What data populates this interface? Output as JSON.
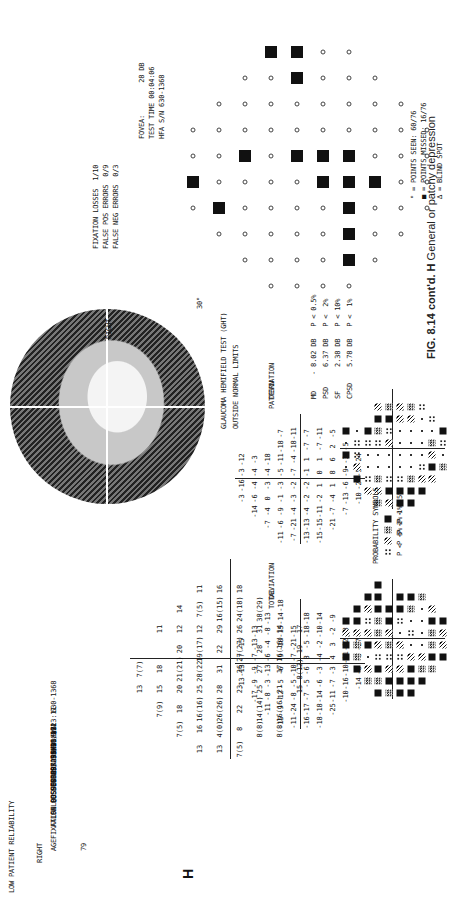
{
  "figure": {
    "caption_label": "FIG. 8.14 cont'd.",
    "caption_panel": "H",
    "caption_text": "General or patchy depression",
    "panel_letter": "H"
  },
  "header_left": {
    "reliability": "LOW PATIENT RELIABILITY",
    "eye": "RIGHT",
    "age_label": "AGE",
    "age": "79",
    "fixation_losses": "FIXATION LOSSES  9/29 xx",
    "false_pos": "FALSE POS ERRORS  5/15 xx",
    "false_neg": "FALSE NEG ERRORS  1/17",
    "questions": "QUESTIONS ASKED  582",
    "fovea": "FOVEA:  30 DB x2",
    "test_time": "TEST TIME 00:13:11",
    "serial": "HFA S/N   630-1368"
  },
  "header_right": {
    "fixation_losses": "FIXATION LOSSES  1/10",
    "false_pos": "FALSE POS ERRORS  0/9",
    "false_neg": "FALSE NEG ERRORS  0/3",
    "fovea": "FOVEA:        28 DB",
    "test_time": "TEST TIME 00:04:06",
    "serial": "HFA S/N 630-1368",
    "eye": "RIGHT",
    "axis_label_top": "30°",
    "axis_label_left": "30°"
  },
  "legend_right": {
    "seen": "° = POINTS SEEN: 60/76",
    "missed": "■ = POINTS MISSED: 16/76",
    "blind_spot": "∆ = BLIND SPOT"
  },
  "grayscale": {
    "axis_label": "30°"
  },
  "indices": {
    "ght": "GLAUCOMA HEMIFIELD TEST (GHT)",
    "ght_result": "OUTSIDE NORMAL LIMITS",
    "rows": [
      {
        "name": "MD",
        "value": "- 8.02 DB",
        "p": "P < 0.5%"
      },
      {
        "name": "PSD",
        "value": "6.37 DB",
        "p": "P <  2%"
      },
      {
        "name": "SF",
        "value": "2.38 DB",
        "p": "P < 10%"
      },
      {
        "name": "CPSD",
        "value": "5.78 DB",
        "p": "P <  1%"
      }
    ]
  },
  "plots": {
    "total_deviation": {
      "label1": "TOTAL",
      "label2": "DEVIATION"
    },
    "pattern_deviation": {
      "label1": "PATTERN",
      "label2": "DEVIATION"
    }
  },
  "probability_symbols": {
    "title": "PROBABILITY SYMBOLS",
    "items": [
      {
        "symbol": "dots4",
        "text": "P <  5%"
      },
      {
        "symbol": "diag",
        "text": "P <  2%"
      },
      {
        "symbol": "chk",
        "text": "P <  1%"
      },
      {
        "symbol": "blk",
        "text": "P < 0.5%"
      }
    ]
  },
  "threshold_values": {
    "rows": [
      [
        "",
        "",
        "",
        "13",
        "7(7)",
        "",
        "",
        "",
        "",
        ""
      ],
      [
        "",
        "",
        "7(9)",
        "15",
        "18",
        "",
        "11",
        "",
        "",
        ""
      ],
      [
        "",
        "7(5)",
        "18",
        "20",
        "21(21)",
        "20",
        "12",
        "14",
        "",
        ""
      ],
      [
        "13",
        "16",
        "16(16)",
        "25",
        "28(22)",
        "19(17)",
        "12",
        "7(5)",
        "11",
        ""
      ],
      [
        "13",
        "4(0)",
        "26(26)",
        "28",
        "31",
        "22",
        "29",
        "16(15)",
        "16",
        ""
      ],
      [
        "7(5)",
        "8",
        "22",
        "23",
        "26",
        "27(27)",
        "26",
        "24(18)",
        "18",
        ""
      ],
      [
        "",
        "8(8)",
        "14(14)",
        "25",
        "27",
        "28",
        "31",
        "38(29)",
        "",
        ""
      ],
      [
        "",
        "8(8)",
        "16(16)",
        "21",
        "17",
        "16(16)",
        "14",
        "",
        "",
        ""
      ],
      [
        "",
        "",
        "",
        "15",
        "8(12)",
        "19",
        "17",
        "",
        "",
        ""
      ]
    ]
  },
  "total_deviation_values": {
    "rows": [
      [
        "",
        "",
        "",
        "-13",
        "-13",
        "-7",
        "-15",
        "",
        "",
        ""
      ],
      [
        "",
        "",
        "-17",
        "-9",
        "-9",
        "-7",
        "-13",
        "-13",
        "",
        ""
      ],
      [
        "",
        "-11",
        "-8",
        "-3",
        "-13",
        "-6",
        "-4",
        "-8",
        "-13",
        ""
      ],
      [
        "-15",
        "-9",
        "-12",
        "-5",
        "-6",
        "-9",
        "-10",
        "-15",
        "-14",
        "-18"
      ],
      [
        "-11",
        "-24",
        "-8",
        "-5",
        "-10",
        "-7",
        "-21",
        "-15",
        "",
        ""
      ],
      [
        "-16",
        "-17",
        "-7",
        "-5",
        "-6",
        "8",
        "-5",
        "-18",
        "-18",
        ""
      ],
      [
        "-18",
        "-18",
        "-14",
        "-6",
        "-3",
        "-4",
        "-2",
        "-10",
        "-14",
        ""
      ],
      [
        "",
        "-25",
        "-11",
        "-7",
        "-3",
        "4",
        "3",
        "-2",
        "-9",
        ""
      ],
      [
        "",
        "",
        "-10",
        "-16",
        "-10",
        "-11",
        "-12",
        "-8",
        "",
        ""
      ],
      [
        "",
        "",
        "",
        "-14",
        "-6",
        "-8",
        "-27",
        "",
        "",
        ""
      ]
    ]
  },
  "pattern_deviation_values": {
    "rows": [
      [
        "",
        "",
        "",
        "-3",
        "-16",
        "-3",
        "-12",
        "",
        "",
        ""
      ],
      [
        "",
        "",
        "-14",
        "-6",
        "-4",
        "-4",
        "-3",
        "",
        "",
        ""
      ],
      [
        "",
        "-7",
        "-4",
        "0",
        "-3",
        "-4",
        "-18",
        "",
        "",
        ""
      ],
      [
        "-11",
        "-6",
        "-9",
        "-1",
        "-3",
        "-5",
        "-11",
        "-18",
        "-7",
        ""
      ],
      [
        "-7",
        "-21",
        "-4",
        "-3",
        "-2",
        "-7",
        "-4",
        "-18",
        "-11",
        ""
      ],
      [
        "-13",
        "-13",
        "-4",
        "-2",
        "-2",
        "-1",
        "1",
        "-7",
        "-7",
        ""
      ],
      [
        "-15",
        "-15",
        "-11",
        "-2",
        "1",
        "0",
        "1",
        "-7",
        "-11",
        ""
      ],
      [
        "",
        "-21",
        "-7",
        "-4",
        "1",
        "8",
        "6",
        "2",
        "-5",
        ""
      ],
      [
        "",
        "",
        "-7",
        "-13",
        "-6",
        "-9",
        "-3",
        "-5",
        "",
        ""
      ],
      [
        "",
        "",
        "",
        "-10",
        "-2",
        "-5",
        "-24",
        "",
        "",
        ""
      ]
    ]
  },
  "colors": {
    "ink": "#111111",
    "paper": "#ffffff",
    "caption": "#222222"
  }
}
